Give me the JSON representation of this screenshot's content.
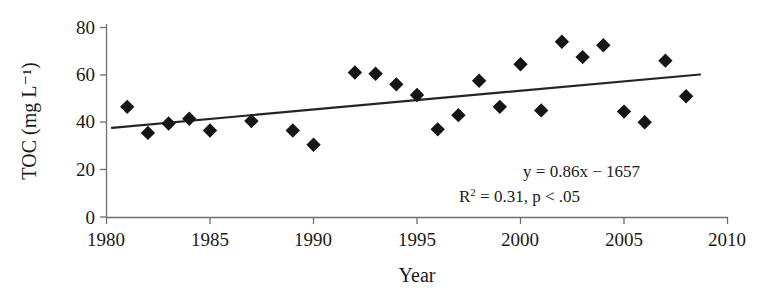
{
  "chart_data": {
    "type": "scatter",
    "title": "",
    "xlabel": "Year",
    "ylabel": "TOC (mg L⁻¹)",
    "xlim": [
      1980,
      2010
    ],
    "ylim": [
      0,
      80
    ],
    "xticks": [
      1980,
      1985,
      1990,
      1995,
      2000,
      2005,
      2010
    ],
    "xtick_labels": [
      "1980",
      "1985",
      "1990",
      "1995",
      "2000",
      "2005",
      "2010"
    ],
    "yticks": [
      0,
      20,
      40,
      60,
      80
    ],
    "ytick_labels": [
      "0",
      "20",
      "40",
      "60",
      "80"
    ],
    "grid": false,
    "legend": null,
    "marker_shape": "diamond",
    "marker_color": "#161616",
    "x": [
      1981,
      1982,
      1983,
      1984,
      1985,
      1987,
      1989,
      1990,
      1992,
      1993,
      1994,
      1995,
      1996,
      1997,
      1998,
      1999,
      2000,
      2001,
      2002,
      2003,
      2004,
      2005,
      2006,
      2007,
      2008
    ],
    "y": [
      46.5,
      35.5,
      39.5,
      41.5,
      36.5,
      40.5,
      36.5,
      30.5,
      61.0,
      60.5,
      56.0,
      51.5,
      37.0,
      43.0,
      57.5,
      46.5,
      64.5,
      45.0,
      74.0,
      67.5,
      72.5,
      44.5,
      40.0,
      66.0,
      51.0
    ],
    "series": [
      {
        "name": "TOC observations",
        "points": [
          {
            "x": 1981,
            "y": 46.5
          },
          {
            "x": 1982,
            "y": 35.5
          },
          {
            "x": 1983,
            "y": 39.5
          },
          {
            "x": 1984,
            "y": 41.5
          },
          {
            "x": 1985,
            "y": 36.5
          },
          {
            "x": 1987,
            "y": 40.5
          },
          {
            "x": 1989,
            "y": 36.5
          },
          {
            "x": 1990,
            "y": 30.5
          },
          {
            "x": 1992,
            "y": 61.0
          },
          {
            "x": 1993,
            "y": 60.5
          },
          {
            "x": 1994,
            "y": 56.0
          },
          {
            "x": 1995,
            "y": 51.5
          },
          {
            "x": 1996,
            "y": 37.0
          },
          {
            "x": 1997,
            "y": 43.0
          },
          {
            "x": 1998,
            "y": 57.5
          },
          {
            "x": 1999,
            "y": 46.5
          },
          {
            "x": 2000,
            "y": 64.5
          },
          {
            "x": 2001,
            "y": 45.0
          },
          {
            "x": 2002,
            "y": 74.0
          },
          {
            "x": 2003,
            "y": 67.5
          },
          {
            "x": 2004,
            "y": 72.5
          },
          {
            "x": 2005,
            "y": 44.5
          },
          {
            "x": 2006,
            "y": 40.0
          },
          {
            "x": 2007,
            "y": 66.0
          },
          {
            "x": 2008,
            "y": 51.0
          }
        ]
      }
    ],
    "trendline": {
      "slope": 0.86,
      "intercept": -1657,
      "x_start": 1980.3,
      "x_end": 2008.7,
      "y_start": 38.0,
      "y_end": 60.0,
      "color": "#242424"
    },
    "annotations": {
      "equation": "y = 0.86x − 1657",
      "stats_prefix": "R",
      "stats_exponent": "2",
      "stats_rest": " = 0.31, p < .05"
    }
  }
}
